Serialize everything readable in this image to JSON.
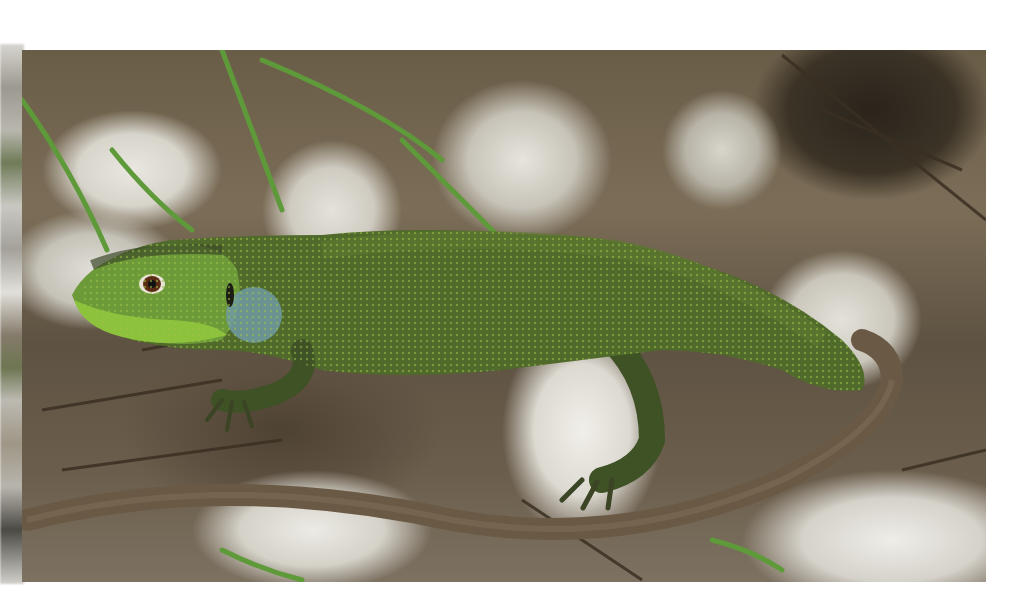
{
  "image": {
    "subject": "green lizard basking on pale limestone rocks among dry twigs and grass",
    "background_color": "#ffffff",
    "frame": {
      "left": 22,
      "top": 50,
      "width": 964,
      "height": 532
    },
    "colors": {
      "lizard_body": "#4f6a2a",
      "lizard_belly_head": "#8dc23c",
      "throat_blue": "#6f9aa3",
      "tail": "#6a5a45",
      "rocks": "#dcd9d1",
      "ground": "#5d5040",
      "grass": "#5f9a3a"
    }
  }
}
